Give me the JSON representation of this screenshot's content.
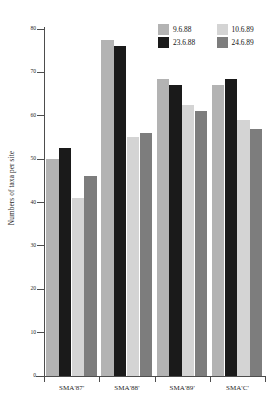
{
  "chart_data": {
    "type": "bar",
    "title": "",
    "xlabel": "",
    "ylabel": "Numbers of taxa per site",
    "ylim": [
      0,
      80
    ],
    "yticks": [
      0,
      10,
      20,
      30,
      40,
      50,
      60,
      70,
      80
    ],
    "ytick_labels": [
      "0",
      "10",
      "20",
      "30",
      "40",
      "50",
      "60",
      "70",
      "80"
    ],
    "grid": false,
    "legend_position": "top-right",
    "categories": [
      "SMA'87'",
      "SMA'88'",
      "SMA'89'",
      "SMA'C'"
    ],
    "series": [
      {
        "name": "9.6.88",
        "color": "#b3b3b3",
        "values": [
          50,
          77.5,
          68.5,
          67
        ]
      },
      {
        "name": "23.6.88",
        "color": "#1a1a1a",
        "values": [
          52.5,
          76,
          67,
          68.5
        ]
      },
      {
        "name": "10.6.89",
        "color": "#d4d4d4",
        "values": [
          41,
          55,
          62.5,
          59
        ]
      },
      {
        "name": "24.6.89",
        "color": "#7d7d7d",
        "values": [
          46,
          56,
          61,
          57
        ]
      }
    ]
  },
  "axis": {
    "y_title": "Numbers of taxa per site"
  },
  "legend": {
    "entries": [
      {
        "label": "9.6.88",
        "color": "#b3b3b3"
      },
      {
        "label": "10.6.89",
        "color": "#d4d4d4"
      },
      {
        "label": "23.6.88",
        "color": "#1a1a1a"
      },
      {
        "label": "24.6.89",
        "color": "#7d7d7d"
      }
    ]
  }
}
